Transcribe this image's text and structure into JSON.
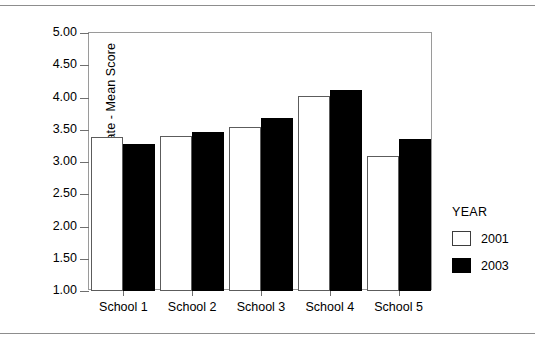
{
  "chart_data": {
    "type": "bar",
    "title": "",
    "xlabel": "",
    "ylabel": "General School Climate - Mean Score",
    "ylim": [
      1.0,
      5.0
    ],
    "ytick_labels": [
      "5.00",
      "4.50",
      "4.00",
      "3.50",
      "3.00",
      "2.50",
      "2.00",
      "1.50",
      "1.00"
    ],
    "ytick_values": [
      5.0,
      4.5,
      4.0,
      3.5,
      3.0,
      2.5,
      2.0,
      1.5,
      1.0
    ],
    "grid": false,
    "legend_position": "right",
    "legend_title": "YEAR",
    "categories": [
      "School 1",
      "School 2",
      "School 3",
      "School 4",
      "School 5"
    ],
    "series": [
      {
        "name": "2001",
        "color": "#ffffff",
        "edge_color": "#5c5c5c",
        "values": [
          3.38,
          3.4,
          3.55,
          4.02,
          3.1
        ]
      },
      {
        "name": "2003",
        "color": "#000000",
        "edge_color": "#000000",
        "values": [
          3.28,
          3.47,
          3.68,
          4.12,
          3.36
        ]
      }
    ]
  },
  "colors": {
    "frame": "#9a9a9a",
    "rule": "#8d8d8d",
    "tick": "#6f6f6f",
    "text": "#000000"
  }
}
